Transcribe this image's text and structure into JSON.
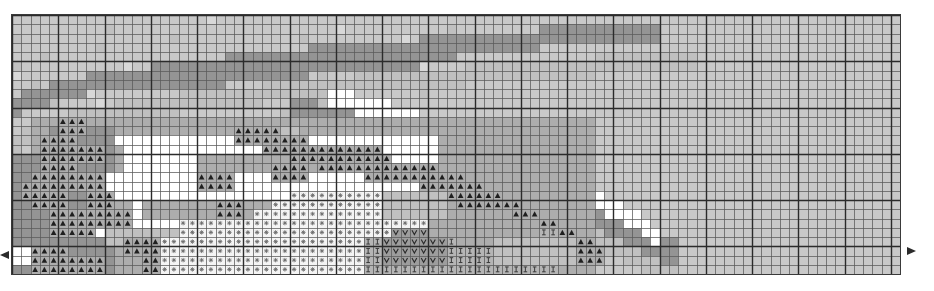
{
  "document": {
    "type": "cross-stitch-pattern-chart",
    "title": "Cross Stitch Pattern Chart",
    "grid": {
      "columns": 96,
      "rows": 28,
      "cell_size_px": 9.25,
      "origin_x_px": 11,
      "origin_y_px": 14,
      "bold_line_every": 5,
      "thin_line_color": "#5a5a5a",
      "bold_line_color": "#2b2b2b",
      "border_color": "#3a3a3a"
    },
    "palette": {
      "background": "#c9c9c9",
      "white": "#ffffff",
      "light_gray": "#d8d8d8",
      "mid_gray": "#c0c0c0",
      "gray": "#adadad",
      "dark_gray": "#949494",
      "symbol_ink": "#1f1f1f"
    },
    "legend": [
      {
        "key": "G0",
        "symbol": "none",
        "symbol_name": "blank-cell",
        "color": "#c9c9c9",
        "label": "background"
      },
      {
        "key": "W",
        "symbol": "none",
        "symbol_name": "blank-cell",
        "color": "#ffffff",
        "label": "white"
      },
      {
        "key": "L",
        "symbol": "none",
        "symbol_name": "blank-cell",
        "color": "#d8d8d8",
        "label": "light gray"
      },
      {
        "key": "M",
        "symbol": "none",
        "symbol_name": "blank-cell",
        "color": "#c0c0c0",
        "label": "mid gray"
      },
      {
        "key": "D",
        "symbol": "none",
        "symbol_name": "blank-cell",
        "color": "#adadad",
        "label": "gray"
      },
      {
        "key": "K",
        "symbol": "none",
        "symbol_name": "blank-cell",
        "color": "#949494",
        "label": "dark gray"
      },
      {
        "key": "T",
        "symbol": "triangle",
        "symbol_name": "triangle-stitch-symbol",
        "color": "#adadad",
        "label": "triangle symbol"
      },
      {
        "key": "A",
        "symbol": "asterisk",
        "symbol_name": "asterisk-stitch-symbol",
        "color": "#f4f4f4",
        "label": "asterisk symbol"
      },
      {
        "key": "V",
        "symbol": "vee",
        "symbol_name": "vee-stitch-symbol",
        "color": "#9d9d9d",
        "label": "vee symbol"
      },
      {
        "key": "I",
        "symbol": "bar",
        "symbol_name": "bar-stitch-symbol",
        "color": "#b5b5b5",
        "label": "bar symbol"
      }
    ],
    "markers": [
      {
        "name": "center-row-marker-left",
        "direction": "right",
        "x": 0,
        "y": 255
      },
      {
        "name": "center-row-marker-right",
        "direction": "left",
        "x": 907,
        "y": 251
      }
    ]
  },
  "chart_data": {
    "type": "heatmap",
    "xlabel": "",
    "ylabel": "",
    "grid": true,
    "legend_position": "none",
    "columns": 96,
    "rows": 28,
    "cell_keys": [
      "G0",
      "W",
      "L",
      "M",
      "D",
      "K",
      "T",
      "A",
      "V",
      "I"
    ],
    "rows_data": [
      "G0G0G0G0G0G0G0G0G0G0G0G0G0G0KKKKMMMMKKKKKG0G0G0G0G0G0G0G0G0G0G0G0G0G0G0G0G0G0G0G0G0G0G0G0G0G0G0G0G0G0G0G0G0G0G0G0G0G0G0G0G0G0G0G0G0G0G0G0G0G0G0G0G0G0G0G0G0G0G0",
      "G0G0G0G0G0G0G0G0G0G0G0G0KKKKKKMMMMMMKKKKG0G0G0G0G0G0G0G0G0G0G0G0G0G0G0G0G0G0G0G0G0G0G0G0G0G0G0G0G0G0G0G0G0G0G0G0G0G0G0G0G0G0G0G0G0G0G0G0G0G0G0G0G0G0G0G0G0G0G0",
      "G0G0G0G0G0G0G0G0G0KKKKKKKMMMMMMMKKKKKKKG0G0G0G0G0G0G0G0G0G0G0G0G0G0G0G0G0G0G0G0G0G0G0G0G0G0G0G0G0G0G0G0G0G0G0G0G0G0G0G0G0G0G0G0G0G0G0G0G0G0G0G0G0G0G0G0G0G0G0G0",
      "G0G0G0G0G0G0G0KKKKKKKKKKMMMMMMKKKKKKKKKG0G0G0G0G0G0G0G0G0G0G0G0G0G0G0G0G0G0G0G0G0G0G0G0G0G0G0G0G0G0G0G0G0G0G0G0G0G0G0G0G0G0G0G0G0G0G0G0G0G0G0G0G0G0G0G0G0G0G0G0"
    ],
    "note": "Pattern cells are generated procedurally in the template renderer from the shape description; rows_data above records the dominant banding of the upper rows."
  },
  "shape": {
    "description": "A large abstract swoosh / fish-like silhouette rendered in gray tonal blocks with stitch symbols, occupying the left two-thirds of a 96x28 count grid.",
    "regions": [
      {
        "name": "upper-arc-band",
        "start_col": 0,
        "end_col": 46,
        "start_row": 0,
        "end_row": 9,
        "tone": "K"
      },
      {
        "name": "body-white-field",
        "start_col": 11,
        "end_col": 44,
        "start_row": 13,
        "end_row": 24,
        "tone": "W"
      },
      {
        "name": "triangle-symbol-field",
        "start_col": 3,
        "end_col": 62,
        "start_row": 11,
        "end_row": 27,
        "tone": "T"
      },
      {
        "name": "asterisk-symbol-field",
        "start_col": 20,
        "end_col": 44,
        "start_row": 20,
        "end_row": 27,
        "tone": "A"
      },
      {
        "name": "vee-symbol-field",
        "start_col": 40,
        "end_col": 46,
        "start_row": 23,
        "end_row": 26,
        "tone": "V"
      },
      {
        "name": "bar-symbol-field",
        "start_col": 38,
        "end_col": 58,
        "start_row": 24,
        "end_row": 27,
        "tone": "I"
      },
      {
        "name": "tail-sweep",
        "start_col": 44,
        "end_col": 68,
        "start_row": 8,
        "end_row": 26,
        "tone": "M"
      }
    ]
  }
}
